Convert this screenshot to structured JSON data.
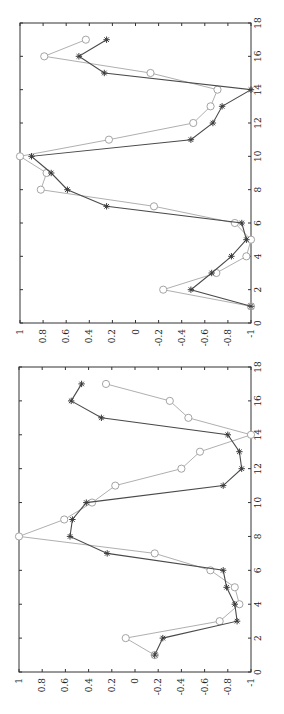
{
  "chart_data": [
    {
      "type": "line",
      "title": "",
      "xlabel": "",
      "ylabel": "",
      "xlim": [
        0,
        18
      ],
      "ylim": [
        -1,
        1
      ],
      "xticks": [
        "0",
        "2",
        "4",
        "6",
        "8",
        "10",
        "12",
        "14",
        "16",
        "18"
      ],
      "yticks": [
        "1",
        "0.8",
        "0.6",
        "0.4",
        "0.2",
        "0",
        "-0.2",
        "-0.4",
        "-0.6",
        "-0.8",
        "-1"
      ],
      "rotation": -90,
      "grid": false,
      "x": [
        1,
        2,
        3,
        4,
        5,
        6,
        7,
        8,
        9,
        10,
        11,
        12,
        13,
        14,
        15,
        16,
        17
      ],
      "series": [
        {
          "name": "star",
          "marker": "star",
          "color": "#4a4a4a",
          "values": [
            -1.0,
            -0.48,
            -0.66,
            -0.83,
            -0.96,
            -0.92,
            0.25,
            0.59,
            0.73,
            0.9,
            -0.48,
            -0.67,
            -0.75,
            -1.0,
            0.27,
            0.49,
            0.25
          ]
        },
        {
          "name": "circle",
          "marker": "circle",
          "color": "#a6a6a6",
          "values": [
            -1.0,
            -0.24,
            -0.7,
            -0.96,
            -1.0,
            -0.86,
            -0.16,
            0.82,
            0.77,
            1.0,
            0.23,
            -0.5,
            -0.65,
            -0.71,
            -0.13,
            0.79,
            0.43
          ]
        }
      ]
    },
    {
      "type": "line",
      "title": "",
      "xlabel": "",
      "ylabel": "",
      "xlim": [
        0,
        18
      ],
      "ylim": [
        -1,
        1
      ],
      "xticks": [
        "0",
        "2",
        "4",
        "6",
        "8",
        "10",
        "12",
        "14",
        "16",
        "18"
      ],
      "yticks": [
        "1",
        "0.8",
        "0.6",
        "0.4",
        "0.2",
        "0",
        "-0.2",
        "-0.4",
        "-0.6",
        "-0.8",
        "-1"
      ],
      "rotation": -90,
      "grid": false,
      "x": [
        1,
        2,
        3,
        4,
        5,
        6,
        7,
        8,
        9,
        10,
        11,
        12,
        13,
        14,
        15,
        16,
        17
      ],
      "series": [
        {
          "name": "star",
          "marker": "star",
          "color": "#4a4a4a",
          "values": [
            -0.17,
            -0.24,
            -0.88,
            -0.86,
            -0.79,
            -0.76,
            0.24,
            0.56,
            0.54,
            0.42,
            -0.76,
            -0.92,
            -0.9,
            -0.8,
            0.29,
            0.55,
            0.46
          ]
        },
        {
          "name": "circle",
          "marker": "circle",
          "color": "#a6a6a6",
          "values": [
            -0.17,
            0.08,
            -0.73,
            -0.9,
            -0.86,
            -0.65,
            -0.17,
            1.0,
            0.61,
            0.37,
            0.17,
            -0.4,
            -0.56,
            -1.0,
            -0.46,
            -0.3,
            0.25
          ]
        }
      ]
    }
  ]
}
